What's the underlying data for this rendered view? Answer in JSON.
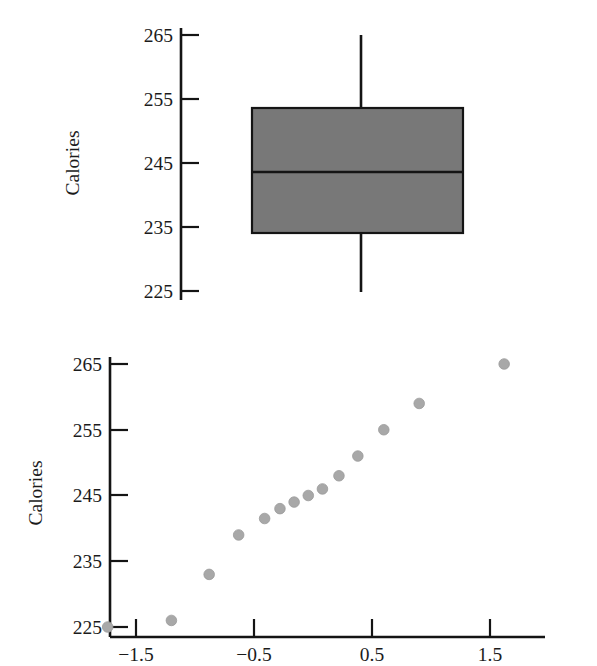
{
  "figure": {
    "background": "#ffffff",
    "ink_color": "#1b1b1b"
  },
  "chart_data": [
    {
      "id": "boxplot",
      "type": "box",
      "title": "",
      "xlabel": "",
      "ylabel": "Calories",
      "ylim": [
        222,
        268
      ],
      "yticks": [
        225,
        235,
        245,
        255,
        265
      ],
      "ytick_labels": [
        "225",
        "235",
        "245",
        "255",
        "265"
      ],
      "grid": false,
      "legend": "none",
      "orientation": "horizontal-box-vertical-scale",
      "box_fill": "#787878",
      "box_edge": "#141414",
      "boxes": [
        {
          "name": "Calories",
          "min": 225.0,
          "q1": 234.5,
          "median": 244.0,
          "q3": 253.5,
          "max": 265.0,
          "outliers": []
        }
      ]
    },
    {
      "id": "normal-probability-plot",
      "type": "scatter",
      "title": "",
      "xlabel": "",
      "ylabel": "Calories",
      "xlim": [
        -1.85,
        1.9
      ],
      "ylim": [
        222.5,
        267
      ],
      "xticks": [
        -1.5,
        -0.5,
        0.5,
        1.5
      ],
      "xtick_labels": [
        "−1.5",
        "−0.5",
        "0.5",
        "1.5"
      ],
      "yticks": [
        225,
        235,
        245,
        255,
        265
      ],
      "ytick_labels": [
        "225",
        "235",
        "245",
        "255",
        "265"
      ],
      "grid": false,
      "legend": "none",
      "marker_color": "#a8a8a8",
      "marker_edge": "#9a9a9a",
      "marker_size": 6,
      "x": [
        -1.74,
        -1.2,
        -0.88,
        -0.63,
        -0.41,
        -0.28,
        -0.16,
        -0.04,
        0.08,
        0.22,
        0.38,
        0.6,
        0.9,
        1.62
      ],
      "y": [
        225.0,
        226.0,
        233.0,
        239.0,
        241.5,
        243.0,
        244.0,
        245.0,
        246.0,
        248.0,
        251.0,
        255.0,
        259.0,
        265.0
      ],
      "points": [
        {
          "x": -1.74,
          "y": 225.0
        },
        {
          "x": -1.2,
          "y": 226.0
        },
        {
          "x": -0.88,
          "y": 233.0
        },
        {
          "x": -0.63,
          "y": 239.0
        },
        {
          "x": -0.41,
          "y": 241.5
        },
        {
          "x": -0.28,
          "y": 243.0
        },
        {
          "x": -0.16,
          "y": 244.0
        },
        {
          "x": -0.04,
          "y": 245.0
        },
        {
          "x": 0.08,
          "y": 246.0
        },
        {
          "x": 0.22,
          "y": 248.0
        },
        {
          "x": 0.38,
          "y": 251.0
        },
        {
          "x": 0.6,
          "y": 255.0
        },
        {
          "x": 0.9,
          "y": 259.0
        },
        {
          "x": 1.62,
          "y": 265.0
        }
      ]
    }
  ],
  "boxplot_panel": {
    "ylabel": "Calories",
    "ytick_labels": [
      "265",
      "255",
      "245",
      "235",
      "225"
    ]
  },
  "scatter_panel": {
    "ylabel": "Calories",
    "ytick_labels": [
      "265",
      "255",
      "245",
      "235",
      "225"
    ],
    "xtick_labels": [
      "−1.5",
      "−0.5",
      "0.5",
      "1.5"
    ]
  }
}
